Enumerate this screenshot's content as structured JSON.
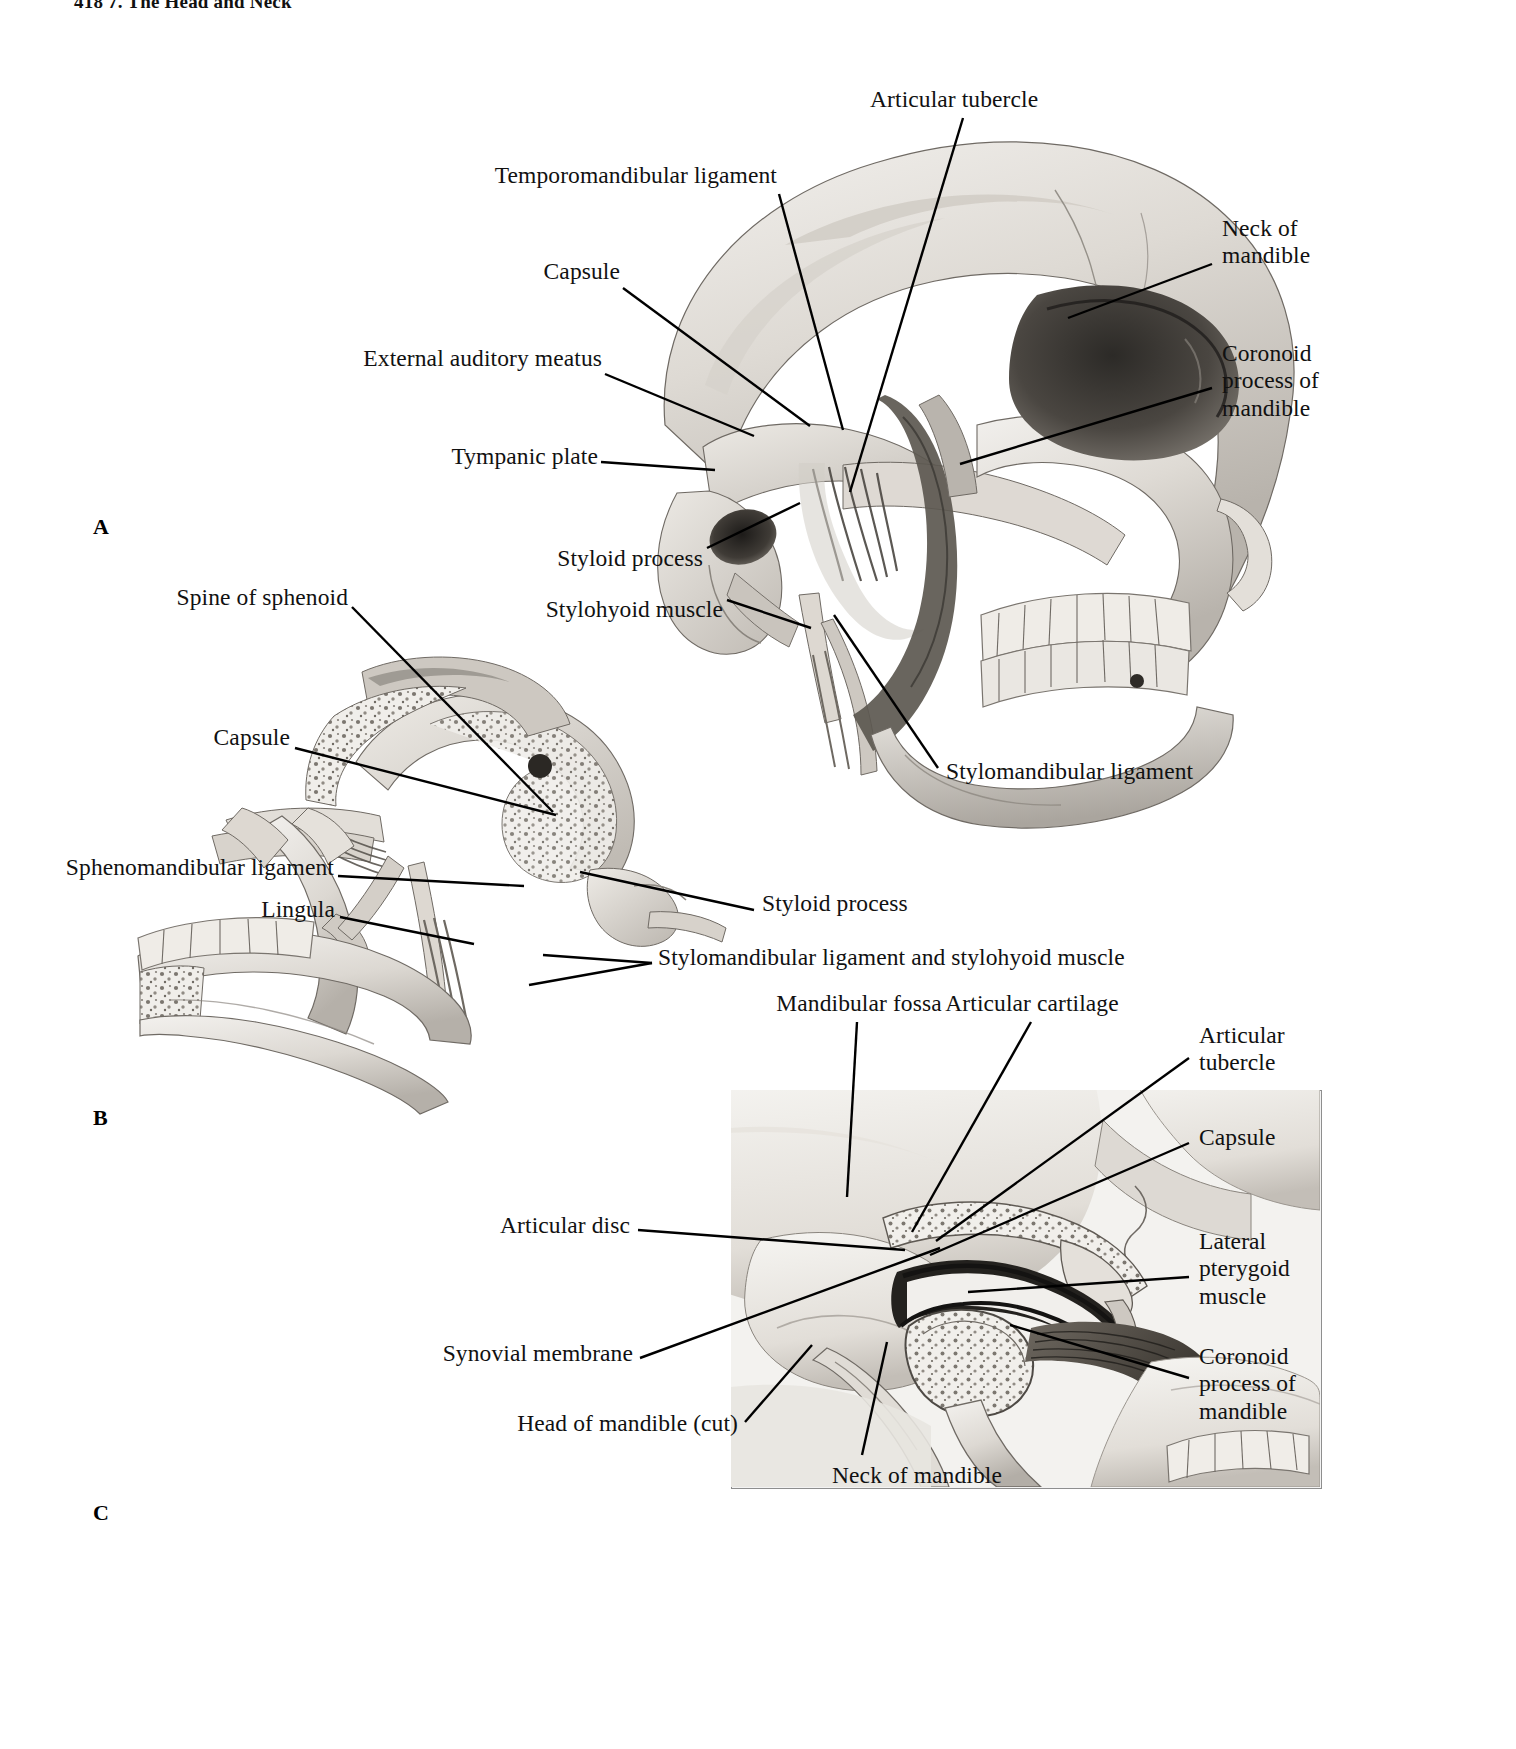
{
  "running_head": "418   7. The Head and Neck",
  "figure": {
    "type": "anatomical-illustration",
    "palette": {
      "bone_light": "#eceae6",
      "bone_mid": "#cfcbc4",
      "bone_shadow": "#8e8a84",
      "cavity_dark": "#3a3732",
      "muscle": "#5b564f",
      "line": "#000000",
      "frame": "#8e8e8e",
      "background": "#ffffff"
    }
  },
  "panels": [
    {
      "id": "A",
      "letter": "A",
      "caption": "Lateral view of skull showing temporomandibular joint ligaments",
      "labels": [
        {
          "key": "articular_tubercle",
          "text": "Articular tubercle",
          "align": "center"
        },
        {
          "key": "temporomandibular_ligament",
          "text": "Temporomandibular ligament",
          "align": "right"
        },
        {
          "key": "capsule",
          "text": "Capsule",
          "align": "right"
        },
        {
          "key": "external_auditory_meatus",
          "text": "External auditory meatus",
          "align": "right"
        },
        {
          "key": "tympanic_plate",
          "text": "Tympanic plate",
          "align": "right"
        },
        {
          "key": "styloid_process",
          "text": "Styloid process",
          "align": "right"
        },
        {
          "key": "stylohyoid_muscle",
          "text": "Stylohyoid muscle",
          "align": "right"
        },
        {
          "key": "neck_of_mandible",
          "text": "Neck of\nmandible",
          "align": "left"
        },
        {
          "key": "coronoid_process",
          "text": "Coronoid\nprocess of\nmandible",
          "align": "left"
        },
        {
          "key": "stylomandibular_ligament",
          "text": "Stylomandibular ligament",
          "align": "left"
        }
      ]
    },
    {
      "id": "B",
      "letter": "B",
      "caption": "Medial view of mandible showing sphenomandibular ligament",
      "labels": [
        {
          "key": "spine_of_sphenoid",
          "text": "Spine of sphenoid",
          "align": "right"
        },
        {
          "key": "capsule_b",
          "text": "Capsule",
          "align": "right"
        },
        {
          "key": "sphenomandibular_ligament",
          "text": "Sphenomandibular ligament",
          "align": "right"
        },
        {
          "key": "lingula",
          "text": "Lingula",
          "align": "right"
        },
        {
          "key": "styloid_process_b",
          "text": "Styloid process",
          "align": "left"
        },
        {
          "key": "stylomandibular_and_stylohyoid",
          "text": "Stylomandibular ligament and stylohyoid muscle",
          "align": "left"
        }
      ]
    },
    {
      "id": "C",
      "letter": "C",
      "caption": "Sagittal section through temporomandibular joint",
      "labels": [
        {
          "key": "mandibular_fossa",
          "text": "Mandibular fossa",
          "align": "center"
        },
        {
          "key": "articular_cartilage",
          "text": "Articular cartilage",
          "align": "center"
        },
        {
          "key": "articular_tubercle_c",
          "text": "Articular\ntubercle",
          "align": "left"
        },
        {
          "key": "capsule_c",
          "text": "Capsule",
          "align": "left"
        },
        {
          "key": "lateral_pterygoid_muscle",
          "text": "Lateral\npterygoid\nmuscle",
          "align": "left"
        },
        {
          "key": "coronoid_process_c",
          "text": "Coronoid\nprocess of\nmandible",
          "align": "left"
        },
        {
          "key": "articular_disc",
          "text": "Articular disc",
          "align": "right"
        },
        {
          "key": "synovial_membrane",
          "text": "Synovial membrane",
          "align": "right"
        },
        {
          "key": "head_of_mandible_cut",
          "text": "Head of mandible (cut)",
          "align": "right"
        },
        {
          "key": "neck_of_mandible_c",
          "text": "Neck of mandible",
          "align": "center"
        }
      ]
    }
  ]
}
